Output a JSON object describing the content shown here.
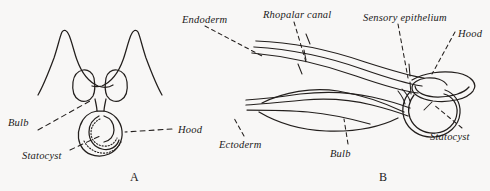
{
  "figure": {
    "background_color": "#f8f7f6",
    "ink_color": "#231f1d",
    "width": 490,
    "height": 191
  },
  "panels": [
    {
      "caption": "A",
      "labels": {
        "bulb": "Bulb",
        "statocyst": "Statocyst",
        "hood": "Hood"
      }
    },
    {
      "caption": "B",
      "labels": {
        "endoderm": "Endoderm",
        "rhopalar_canal": "Rhopalar canal",
        "sensory_epithelium": "Sensory epithelium",
        "hood": "Hood",
        "ectoderm": "Ectoderm",
        "bulb": "Bulb",
        "statocyst": "Statocyst"
      }
    }
  ]
}
